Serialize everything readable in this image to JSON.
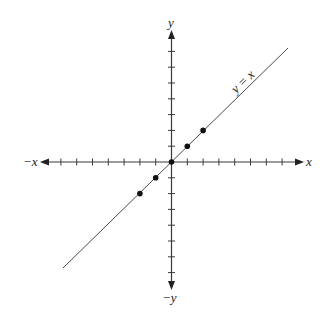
{
  "chart_data": {
    "type": "line",
    "title": "",
    "xlabel": "x",
    "ylabel": "y",
    "axis_labels": {
      "x_positive": "x",
      "x_negative": "−x",
      "y_positive": "y",
      "y_negative": "−y"
    },
    "xlim": [
      -7,
      7
    ],
    "ylim": [
      -7,
      7
    ],
    "ticks_per_side": 7,
    "tick_labels_shown": false,
    "grid": false,
    "series": [
      {
        "name": "y = x",
        "label": "y = x",
        "kind": "line",
        "x": [
          -7,
          7
        ],
        "y": [
          -7,
          7
        ]
      },
      {
        "name": "points",
        "kind": "scatter",
        "x": [
          -2,
          -1,
          0,
          1,
          2
        ],
        "y": [
          -2,
          -1,
          0,
          1,
          2
        ]
      }
    ],
    "annotations": [
      {
        "text": "y = x",
        "near": [
          4.3,
          5.3
        ],
        "rotation_deg": -44
      }
    ]
  },
  "style": {
    "axis_color": "#3a3a3a",
    "line_color": "#4a4a4a",
    "point_color": "#111111"
  }
}
